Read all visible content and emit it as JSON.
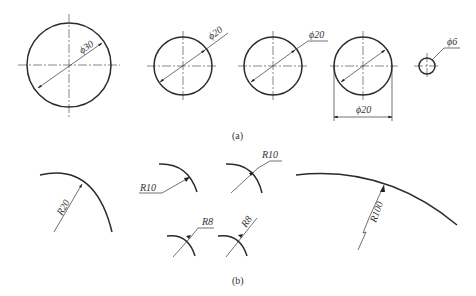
{
  "figure": {
    "part_a": {
      "caption": "(a)",
      "items": [
        {
          "id": "circle-d30",
          "label": "ϕ30",
          "style": "diameter line inside circle, text on line"
        },
        {
          "id": "circle-d20-a",
          "label": "ϕ20",
          "style": "diameter line extended outside with text"
        },
        {
          "id": "circle-d20-b",
          "label": "ϕ20",
          "style": "diameter line with leader shoulder"
        },
        {
          "id": "circle-d20-c",
          "label": "ϕ20",
          "style": "linear dimension below circle"
        },
        {
          "id": "circle-d6",
          "label": "ϕ6",
          "style": "leader with shoulder, small circle"
        }
      ]
    },
    "part_b": {
      "caption": "(b)",
      "items": [
        {
          "id": "arc-r20",
          "label": "R20",
          "style": "radius inside arc"
        },
        {
          "id": "arc-r10-a",
          "label": "R10",
          "style": "leader with shoulder to left"
        },
        {
          "id": "arc-r10-b",
          "label": "R10",
          "style": "leader with shoulder to right"
        },
        {
          "id": "arc-r8-a",
          "label": "R8",
          "style": "leader with shoulder"
        },
        {
          "id": "arc-r8-b",
          "label": "R8",
          "style": "text along leader"
        },
        {
          "id": "arc-r100",
          "label": "R100",
          "style": "jogged radius for large arc"
        }
      ]
    }
  }
}
